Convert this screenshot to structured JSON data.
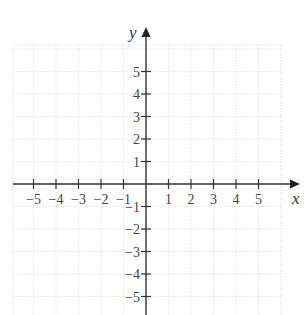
{
  "diagram": {
    "type": "cartesian-coordinate-plane",
    "x_axis": {
      "label": "x",
      "min": -5,
      "max": 5,
      "ticks": [
        -5,
        -4,
        -3,
        -2,
        -1,
        1,
        2,
        3,
        4,
        5
      ],
      "tick_labels": [
        "−5",
        "−4",
        "−3",
        "−2",
        "−1",
        "1",
        "2",
        "3",
        "4",
        "5"
      ],
      "arrow": "right"
    },
    "y_axis": {
      "label": "y",
      "min": -5,
      "max": 5,
      "ticks": [
        5,
        4,
        3,
        2,
        1,
        -1,
        -2,
        -3,
        -4,
        -5
      ],
      "tick_labels": [
        "5",
        "4",
        "3",
        "2",
        "1",
        "−1",
        "−2",
        "−3",
        "−4",
        "−5"
      ],
      "arrow": "up"
    },
    "grid": {
      "visible": true,
      "style": "dotted",
      "color": "#e6e6e6"
    },
    "colors": {
      "axis": "#333333",
      "text": "#444444"
    }
  },
  "layout": {
    "origin_px": [
      146,
      184
    ],
    "unit_px": 22.5,
    "grid_bounds_px": {
      "left": 13,
      "right": 281,
      "top": 45,
      "bottom": 315
    }
  }
}
